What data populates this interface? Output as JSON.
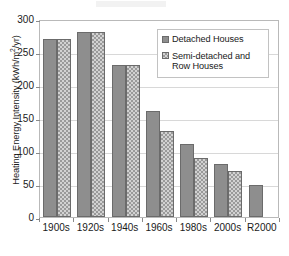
{
  "chart_data": {
    "type": "bar",
    "title": "",
    "subtitle": "",
    "xlabel": "",
    "ylabel": "Heating Energy Intensity (kWh/m2/yr)",
    "ylabel_parts": {
      "prefix": "Heating Energy Intensity (kWh/m",
      "superscript": "2",
      "suffix": "/yr)"
    },
    "categories": [
      "1900s",
      "1920s",
      "1940s",
      "1960s",
      "1980s",
      "2000s",
      "R2000"
    ],
    "series": [
      {
        "name": "Detached Houses",
        "values": [
          270,
          280,
          230,
          160,
          110,
          80,
          49
        ]
      },
      {
        "name": "Semi-detached and Row Houses",
        "values": [
          270,
          280,
          230,
          130,
          90,
          70,
          null
        ]
      }
    ],
    "ylim": [
      0,
      300
    ],
    "ytick_labels": [
      "0",
      "50",
      "100",
      "150",
      "200",
      "250",
      "300"
    ],
    "ytick_values": [
      0,
      50,
      100,
      150,
      200,
      250,
      300
    ],
    "grid": true,
    "grid_axis": "y",
    "legend_position": "upper right",
    "legend_entries": [
      {
        "label": "Detached Houses",
        "swatch": "solid-gray-swatch"
      },
      {
        "label": "Semi-detached and Row Houses",
        "swatch": "checkered-gray-swatch"
      }
    ],
    "colors": {
      "series_0_fill": "#8e8e8e",
      "series_1_fill": "#d2d2d2",
      "series_1_pattern": "#9a9a9a",
      "bar_outline": "#6b6b6b",
      "gridline": "#d8d8d8",
      "axis_line": "#b9b9b9",
      "text": "#1a1a1a"
    }
  }
}
